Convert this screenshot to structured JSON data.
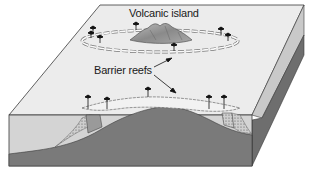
{
  "diagram": {
    "labels": {
      "volcanic_island": "Volcanic island",
      "barrier_reefs": "Barrier reefs"
    },
    "colors": {
      "top_face": "#ececec",
      "water_front": "#d4d4d4",
      "seafloor": "#7a7a7a",
      "right_face_upper": "#c9c9c9",
      "right_face_lower": "#6e6e6e",
      "reef": "#f2f2f2",
      "island": "#9a9a9a",
      "outline": "#3a3a3a"
    },
    "icons": [
      "palm-tree-icon",
      "arrow-icon"
    ]
  }
}
